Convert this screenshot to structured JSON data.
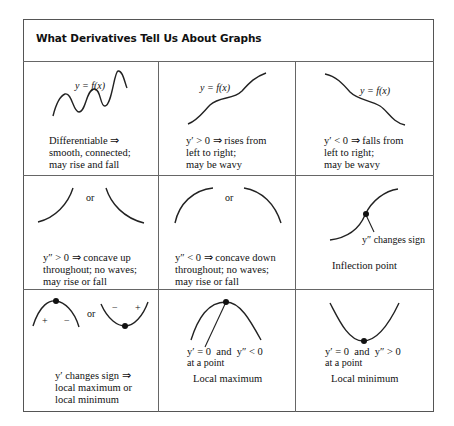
{
  "title": "What Derivatives Tell Us About Graphs",
  "cells": [
    {
      "graph_label": "y = f(x)",
      "caption": [
        "Differentiable ⇒",
        "smooth, connected;",
        "may rise and fall"
      ]
    },
    {
      "graph_label": "y = f(x)",
      "caption": [
        "y′ > 0 ⇒ rises from",
        "left to right;",
        "may be wavy"
      ]
    },
    {
      "graph_label": "y = f(x)",
      "caption": [
        "y′ < 0 ⇒ falls from",
        "left to right;",
        "may be wavy"
      ]
    },
    {
      "or_label": "or",
      "caption": [
        "y″ > 0 ⇒ concave up",
        "throughout; no waves;",
        "may rise or fall"
      ]
    },
    {
      "or_label": "or",
      "caption": [
        "y″ < 0 ⇒ concave down",
        "throughout; no waves;",
        "may rise or fall"
      ]
    },
    {
      "point_label": "y″ changes sign",
      "caption": [
        "Inflection point"
      ]
    },
    {
      "or_label": "or",
      "signs_left": [
        "+",
        "−"
      ],
      "signs_right": [
        "−",
        "+"
      ],
      "caption": [
        "y′ changes sign ⇒",
        "local maximum or",
        "local minimum"
      ]
    },
    {
      "condition": [
        "y′ = 0  and  y″ < 0",
        "at a point"
      ],
      "caption": [
        "Local maximum"
      ]
    },
    {
      "condition": [
        "y′ = 0  and  y″ > 0",
        "at a point"
      ],
      "caption": [
        "Local minimum"
      ]
    }
  ]
}
